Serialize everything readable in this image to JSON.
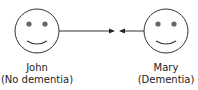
{
  "people": [
    {
      "name": "John",
      "status": "(No dementia)"
    },
    {
      "name": "Mary",
      "status": "(Dementia)"
    }
  ],
  "connector": {
    "type": "bidirectional-arrows-meeting"
  },
  "colors": {
    "stroke": "#333333",
    "eyes": "#666666"
  }
}
